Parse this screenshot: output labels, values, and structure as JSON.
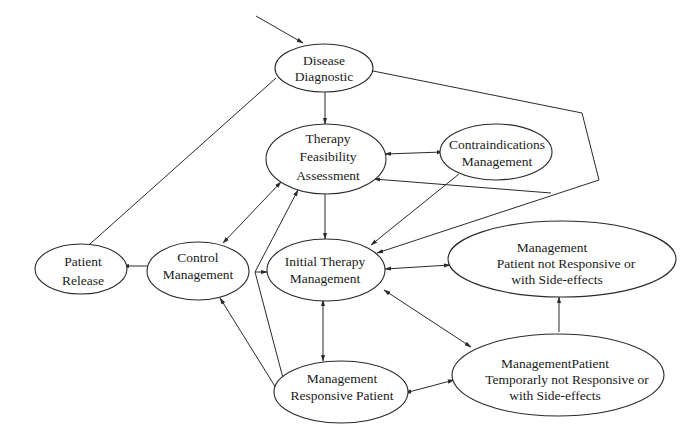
{
  "diagram": {
    "type": "state-transition",
    "nodes": [
      {
        "id": "disease_diagnostic",
        "lines": [
          "Disease",
          "Diagnostic"
        ]
      },
      {
        "id": "therapy_feasibility",
        "lines": [
          "Therapy",
          "Feasibility",
          "Assessment"
        ]
      },
      {
        "id": "contraindications",
        "lines": [
          "Contraindications",
          "Management"
        ]
      },
      {
        "id": "patient_release",
        "lines": [
          "Patient",
          "Release"
        ]
      },
      {
        "id": "control_management",
        "lines": [
          "Control",
          "Management"
        ]
      },
      {
        "id": "initial_therapy",
        "lines": [
          "Initial Therapy",
          "Management"
        ]
      },
      {
        "id": "not_responsive",
        "lines": [
          "Management",
          "Patient not Responsive or",
          "with Side-effects"
        ]
      },
      {
        "id": "responsive_patient",
        "lines": [
          "Management",
          "Responsive Patient"
        ]
      },
      {
        "id": "temporarily_not_responsive",
        "lines": [
          "ManagementPatient",
          "Temporarly not Responsive or",
          "with Side-effects"
        ]
      }
    ],
    "edges": [
      {
        "from": "start",
        "to": "disease_diagnostic"
      },
      {
        "from": "disease_diagnostic",
        "to": "therapy_feasibility"
      },
      {
        "from": "disease_diagnostic",
        "to": "patient_release"
      },
      {
        "from": "disease_diagnostic",
        "to": "initial_therapy",
        "routing": "polyline-right"
      },
      {
        "from": "therapy_feasibility",
        "to": "contraindications",
        "bidirectional": true
      },
      {
        "from": "therapy_feasibility",
        "to": "initial_therapy"
      },
      {
        "from": "therapy_feasibility",
        "to": "control_management",
        "bidirectional": true
      },
      {
        "from": "contraindications",
        "to": "initial_therapy"
      },
      {
        "from": "not_responsive",
        "to": "therapy_feasibility"
      },
      {
        "from": "control_management",
        "to": "patient_release"
      },
      {
        "from": "control_management",
        "to": "initial_therapy"
      },
      {
        "from": "responsive_patient",
        "to": "control_management"
      },
      {
        "from": "responsive_patient",
        "to": "therapy_feasibility"
      },
      {
        "from": "initial_therapy",
        "to": "not_responsive",
        "bidirectional": true
      },
      {
        "from": "initial_therapy",
        "to": "responsive_patient",
        "bidirectional": true
      },
      {
        "from": "initial_therapy",
        "to": "temporarily_not_responsive",
        "bidirectional": true
      },
      {
        "from": "responsive_patient",
        "to": "temporarily_not_responsive",
        "bidirectional": true
      },
      {
        "from": "temporarily_not_responsive",
        "to": "not_responsive"
      }
    ]
  }
}
